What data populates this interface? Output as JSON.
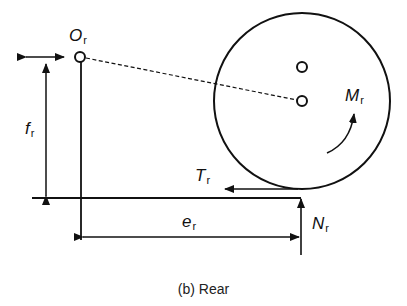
{
  "diagram": {
    "caption": "(b) Rear",
    "labels": {
      "pivot": {
        "symbol": "O",
        "subscript": "r"
      },
      "height": {
        "symbol": "f",
        "subscript": "r"
      },
      "offset": {
        "symbol": "e",
        "subscript": "r"
      },
      "moment": {
        "symbol": "M",
        "subscript": "r"
      },
      "traction": {
        "symbol": "T",
        "subscript": "r"
      },
      "normal": {
        "symbol": "N",
        "subscript": "r"
      }
    },
    "colors": {
      "line": "#111111",
      "background": "#ffffff"
    }
  }
}
